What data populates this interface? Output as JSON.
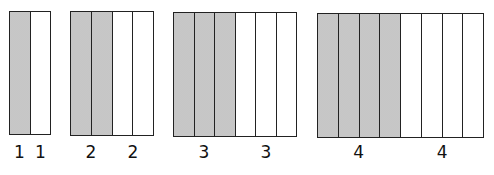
{
  "diagram": {
    "shade_color": "#d6d6d6",
    "line_color": "#222222",
    "figures": [
      {
        "id": "fig1",
        "shaded_parts": 1,
        "unshaded_parts": 1,
        "labels": [
          "1",
          "1"
        ],
        "box": {
          "left": 9,
          "top": 11,
          "width": 42,
          "height": 124
        }
      },
      {
        "id": "fig2",
        "shaded_parts": 2,
        "unshaded_parts": 2,
        "labels": [
          "2",
          "2"
        ],
        "box": {
          "left": 70,
          "top": 11,
          "width": 84,
          "height": 125
        }
      },
      {
        "id": "fig3",
        "shaded_parts": 3,
        "unshaded_parts": 3,
        "labels": [
          "3",
          "3"
        ],
        "box": {
          "left": 173,
          "top": 12,
          "width": 124,
          "height": 125
        }
      },
      {
        "id": "fig4",
        "shaded_parts": 4,
        "unshaded_parts": 4,
        "labels": [
          "4",
          "4"
        ],
        "box": {
          "left": 317,
          "top": 13,
          "width": 167,
          "height": 125
        }
      }
    ],
    "caption": ""
  }
}
